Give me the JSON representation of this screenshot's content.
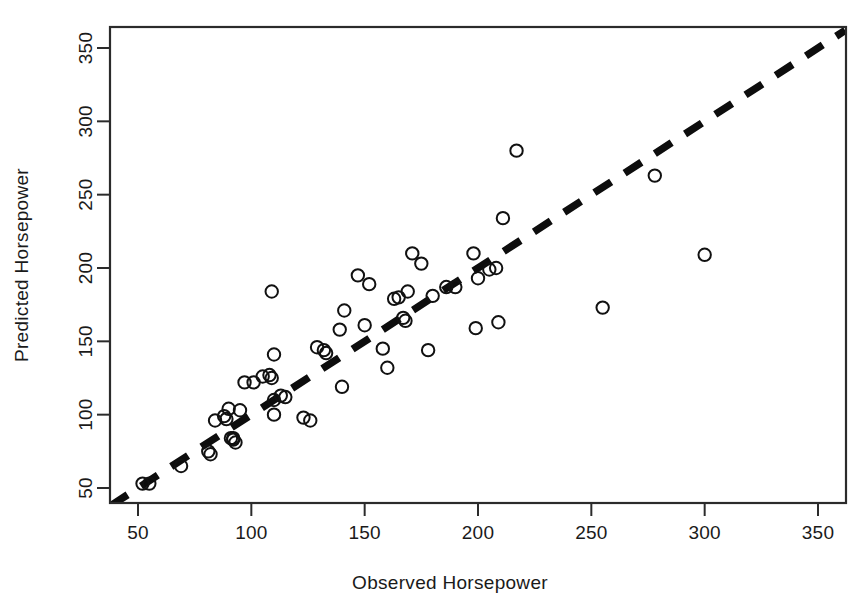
{
  "chart_data": {
    "type": "scatter",
    "title": "",
    "xlabel": "Observed Horsepower",
    "ylabel": "Predicted Horsepower",
    "xlim": [
      38,
      362
    ],
    "ylim": [
      38,
      362
    ],
    "xticks": [
      50,
      100,
      150,
      200,
      250,
      300,
      350
    ],
    "yticks": [
      50,
      100,
      150,
      200,
      250,
      300,
      350
    ],
    "xticklabels": [
      "50",
      "100",
      "150",
      "200",
      "250",
      "300",
      "350"
    ],
    "yticklabels": [
      "50",
      "100",
      "150",
      "200",
      "250",
      "300",
      "350"
    ],
    "grid": false,
    "legend": null,
    "marker": "open-circle",
    "marker_color": "#111111",
    "reference_line": {
      "name": "identity-line",
      "style": "dashed",
      "color": "#0d0d0d",
      "linewidth": 7.5,
      "x": [
        38,
        362
      ],
      "y": [
        38,
        362
      ],
      "slope": 1,
      "intercept": 0
    },
    "points": [
      {
        "x": 52,
        "y": 53
      },
      {
        "x": 55,
        "y": 53
      },
      {
        "x": 69,
        "y": 65
      },
      {
        "x": 81,
        "y": 75
      },
      {
        "x": 82,
        "y": 73
      },
      {
        "x": 84,
        "y": 96
      },
      {
        "x": 88,
        "y": 99
      },
      {
        "x": 89,
        "y": 97
      },
      {
        "x": 90,
        "y": 104
      },
      {
        "x": 91,
        "y": 84
      },
      {
        "x": 92,
        "y": 84
      },
      {
        "x": 92,
        "y": 83
      },
      {
        "x": 93,
        "y": 81
      },
      {
        "x": 95,
        "y": 103
      },
      {
        "x": 97,
        "y": 122
      },
      {
        "x": 101,
        "y": 122
      },
      {
        "x": 105,
        "y": 126
      },
      {
        "x": 108,
        "y": 127
      },
      {
        "x": 109,
        "y": 125
      },
      {
        "x": 109,
        "y": 184
      },
      {
        "x": 110,
        "y": 141
      },
      {
        "x": 110,
        "y": 110
      },
      {
        "x": 110,
        "y": 100
      },
      {
        "x": 113,
        "y": 113
      },
      {
        "x": 115,
        "y": 112
      },
      {
        "x": 123,
        "y": 98
      },
      {
        "x": 126,
        "y": 96
      },
      {
        "x": 129,
        "y": 146
      },
      {
        "x": 132,
        "y": 144
      },
      {
        "x": 133,
        "y": 142
      },
      {
        "x": 139,
        "y": 158
      },
      {
        "x": 140,
        "y": 119
      },
      {
        "x": 141,
        "y": 171
      },
      {
        "x": 147,
        "y": 195
      },
      {
        "x": 150,
        "y": 161
      },
      {
        "x": 152,
        "y": 189
      },
      {
        "x": 158,
        "y": 145
      },
      {
        "x": 160,
        "y": 132
      },
      {
        "x": 163,
        "y": 179
      },
      {
        "x": 165,
        "y": 180
      },
      {
        "x": 167,
        "y": 166
      },
      {
        "x": 168,
        "y": 164
      },
      {
        "x": 169,
        "y": 184
      },
      {
        "x": 171,
        "y": 210
      },
      {
        "x": 175,
        "y": 203
      },
      {
        "x": 178,
        "y": 144
      },
      {
        "x": 180,
        "y": 181
      },
      {
        "x": 186,
        "y": 187
      },
      {
        "x": 190,
        "y": 187
      },
      {
        "x": 198,
        "y": 210
      },
      {
        "x": 199,
        "y": 159
      },
      {
        "x": 200,
        "y": 193
      },
      {
        "x": 205,
        "y": 199
      },
      {
        "x": 208,
        "y": 200
      },
      {
        "x": 209,
        "y": 163
      },
      {
        "x": 211,
        "y": 234
      },
      {
        "x": 217,
        "y": 280
      },
      {
        "x": 255,
        "y": 173
      },
      {
        "x": 278,
        "y": 263
      },
      {
        "x": 300,
        "y": 209
      }
    ]
  },
  "axes": {
    "x_title": "Observed Horsepower",
    "y_title": "Predicted Horsepower",
    "x_tick_labels": [
      "50",
      "100",
      "150",
      "200",
      "250",
      "300",
      "350"
    ],
    "y_tick_labels": [
      "50",
      "100",
      "150",
      "200",
      "250",
      "300",
      "350"
    ]
  }
}
